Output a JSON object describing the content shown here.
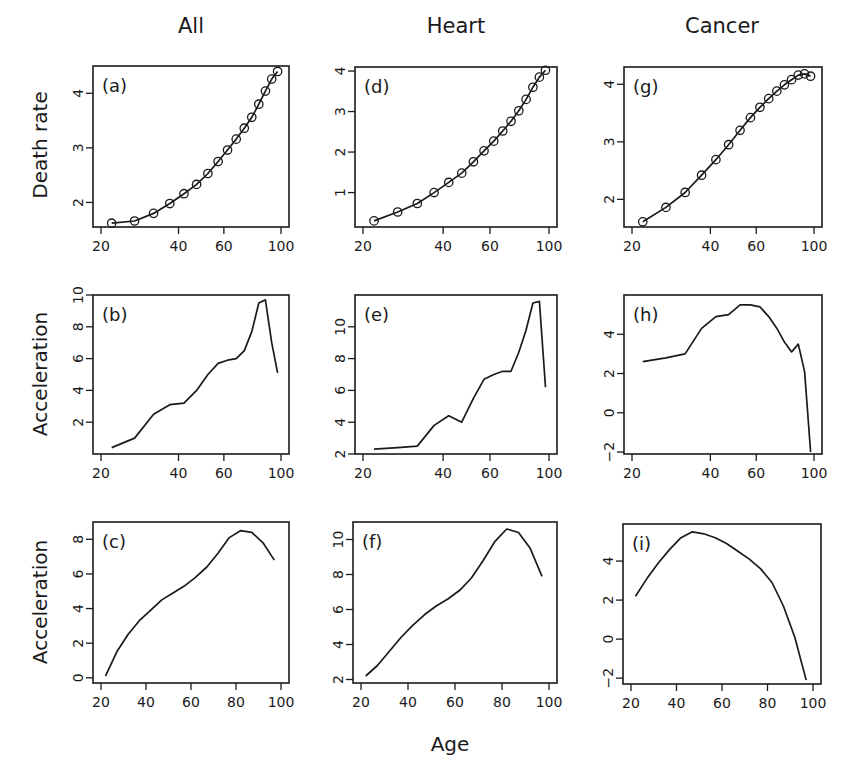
{
  "figure": {
    "column_titles": [
      "All",
      "Heart",
      "Cancer"
    ],
    "row_ylabels": [
      "Death rate",
      "Acceleration",
      "Acceleration"
    ],
    "xlabel": "Age",
    "colors": {
      "line": "#1a1a1a",
      "axis": "#1a1a1a",
      "background": "#ffffff"
    }
  },
  "chart_data": [
    {
      "panel": "(a)",
      "column": "All",
      "type": "line",
      "markers": "circle",
      "xlabel": "",
      "ylabel": "Death rate",
      "xscale": "log",
      "xlim": [
        20,
        100
      ],
      "ylim": [
        1.55,
        4.5
      ],
      "xticks": [
        20,
        40,
        60,
        100
      ],
      "yticks": [
        2,
        3,
        4
      ],
      "x": [
        22,
        27,
        32,
        37,
        42,
        47,
        52,
        57,
        62,
        67,
        72,
        77,
        82,
        87,
        92,
        97
      ],
      "values": [
        1.62,
        1.66,
        1.8,
        1.98,
        2.16,
        2.33,
        2.53,
        2.75,
        2.96,
        3.16,
        3.36,
        3.56,
        3.8,
        4.04,
        4.26,
        4.4
      ]
    },
    {
      "panel": "(b)",
      "column": "All",
      "type": "line",
      "ylabel": "Acceleration",
      "xscale": "log",
      "xlim": [
        20,
        100
      ],
      "ylim": [
        0,
        10
      ],
      "xticks": [
        20,
        40,
        60,
        100
      ],
      "yticks": [
        2,
        4,
        6,
        8,
        10
      ],
      "x": [
        22,
        27,
        32,
        37,
        42,
        47,
        52,
        57,
        62,
        67,
        72,
        77,
        82,
        87,
        92,
        97
      ],
      "values": [
        0.4,
        1.0,
        2.5,
        3.1,
        3.2,
        4.0,
        5.0,
        5.7,
        5.9,
        6.0,
        6.5,
        7.7,
        9.5,
        9.7,
        7.0,
        5.1
      ]
    },
    {
      "panel": "(c)",
      "column": "All",
      "type": "line",
      "ylabel": "Acceleration",
      "xscale": "linear",
      "xlim": [
        20,
        100
      ],
      "ylim": [
        -0.3,
        9
      ],
      "xticks": [
        20,
        40,
        60,
        80,
        100
      ],
      "yticks": [
        0,
        2,
        4,
        6,
        8
      ],
      "x": [
        22,
        27,
        32,
        37,
        42,
        47,
        52,
        57,
        62,
        67,
        72,
        77,
        82,
        87,
        92,
        97
      ],
      "values": [
        0.1,
        1.5,
        2.5,
        3.3,
        3.9,
        4.5,
        4.9,
        5.3,
        5.8,
        6.4,
        7.2,
        8.1,
        8.5,
        8.4,
        7.8,
        6.8
      ]
    },
    {
      "panel": "(d)",
      "column": "Heart",
      "type": "line",
      "markers": "circle",
      "ylabel": "Death rate",
      "xscale": "log",
      "xlim": [
        20,
        100
      ],
      "ylim": [
        0.15,
        4.1
      ],
      "xticks": [
        20,
        40,
        60,
        100
      ],
      "yticks": [
        1,
        2,
        3,
        4
      ],
      "x": [
        22,
        27,
        32,
        37,
        42,
        47,
        52,
        57,
        62,
        67,
        72,
        77,
        82,
        87,
        92,
        97
      ],
      "values": [
        0.3,
        0.52,
        0.73,
        1.0,
        1.25,
        1.48,
        1.76,
        2.03,
        2.27,
        2.52,
        2.76,
        3.02,
        3.3,
        3.6,
        3.85,
        4.02
      ]
    },
    {
      "panel": "(e)",
      "column": "Heart",
      "type": "line",
      "ylabel": "Acceleration",
      "xscale": "log",
      "xlim": [
        20,
        100
      ],
      "ylim": [
        2,
        12
      ],
      "xticks": [
        20,
        40,
        60,
        100
      ],
      "yticks": [
        2,
        4,
        6,
        8,
        10
      ],
      "x": [
        22,
        27,
        32,
        37,
        42,
        47,
        52,
        57,
        62,
        67,
        72,
        77,
        82,
        87,
        92,
        97
      ],
      "values": [
        2.3,
        2.4,
        2.5,
        3.8,
        4.4,
        4.0,
        5.5,
        6.7,
        7.0,
        7.2,
        7.2,
        8.4,
        9.8,
        11.5,
        11.6,
        6.2
      ]
    },
    {
      "panel": "(f)",
      "column": "Heart",
      "type": "line",
      "ylabel": "Acceleration",
      "xscale": "linear",
      "xlim": [
        20,
        100
      ],
      "ylim": [
        1.8,
        11
      ],
      "xticks": [
        20,
        40,
        60,
        80,
        100
      ],
      "yticks": [
        2,
        4,
        6,
        8,
        10
      ],
      "x": [
        22,
        27,
        32,
        37,
        42,
        47,
        52,
        57,
        62,
        67,
        72,
        77,
        82,
        87,
        92,
        97
      ],
      "values": [
        2.2,
        2.8,
        3.6,
        4.4,
        5.1,
        5.7,
        6.2,
        6.6,
        7.1,
        7.8,
        8.8,
        9.9,
        10.6,
        10.4,
        9.5,
        7.9
      ]
    },
    {
      "panel": "(g)",
      "column": "Cancer",
      "type": "line",
      "markers": "circle",
      "ylabel": "Death rate",
      "xscale": "log",
      "xlim": [
        20,
        100
      ],
      "ylim": [
        1.52,
        4.3
      ],
      "xticks": [
        20,
        40,
        60,
        100
      ],
      "yticks": [
        2,
        3,
        4
      ],
      "x": [
        22,
        27,
        32,
        37,
        42,
        47,
        52,
        57,
        62,
        67,
        72,
        77,
        82,
        87,
        92,
        97
      ],
      "values": [
        1.61,
        1.86,
        2.12,
        2.42,
        2.69,
        2.95,
        3.2,
        3.42,
        3.6,
        3.75,
        3.88,
        3.99,
        4.08,
        4.16,
        4.18,
        4.14
      ]
    },
    {
      "panel": "(h)",
      "column": "Cancer",
      "type": "line",
      "ylabel": "Acceleration",
      "xscale": "log",
      "xlim": [
        20,
        100
      ],
      "ylim": [
        -2.1,
        6.0
      ],
      "xticks": [
        20,
        40,
        60,
        100
      ],
      "yticks": [
        -2,
        0,
        2,
        4
      ],
      "x": [
        22,
        27,
        32,
        37,
        42,
        47,
        52,
        57,
        62,
        67,
        72,
        77,
        82,
        87,
        92,
        97
      ],
      "values": [
        2.6,
        2.8,
        3.0,
        4.3,
        4.9,
        5.0,
        5.5,
        5.5,
        5.4,
        4.9,
        4.3,
        3.6,
        3.1,
        3.5,
        2.1,
        -2.0
      ]
    },
    {
      "panel": "(i)",
      "column": "Cancer",
      "type": "line",
      "ylabel": "Acceleration",
      "xscale": "linear",
      "xlim": [
        20,
        100
      ],
      "ylim": [
        -2.3,
        5.9
      ],
      "xticks": [
        20,
        40,
        60,
        80,
        100
      ],
      "yticks": [
        -2,
        0,
        2,
        4
      ],
      "x": [
        22,
        27,
        32,
        37,
        42,
        47,
        52,
        57,
        62,
        67,
        72,
        77,
        82,
        87,
        92,
        97
      ],
      "values": [
        2.2,
        3.1,
        3.9,
        4.6,
        5.2,
        5.5,
        5.4,
        5.2,
        4.9,
        4.5,
        4.1,
        3.6,
        2.9,
        1.7,
        0.1,
        -2.1
      ]
    }
  ]
}
